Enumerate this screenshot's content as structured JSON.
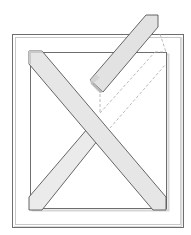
{
  "diagram": {
    "title": "",
    "colors": {
      "background": "#ffffff",
      "frame_stroke": "#6e6e6e",
      "frame_light": "#c8c8c8",
      "frame_shadow": "#b4b4b4",
      "brace_fill": "#e4e4e4",
      "brace_fill_dark": "#cfcfcf",
      "brace_stroke": "#555555",
      "dashed": "#a8a8a8"
    },
    "elements": [
      {
        "id": "outer-frame",
        "label": ""
      },
      {
        "id": "inner-opening",
        "label": ""
      },
      {
        "id": "brace-diagonal-down",
        "label": ""
      },
      {
        "id": "brace-diagonal-up-lower",
        "label": ""
      },
      {
        "id": "brace-lifted",
        "label": ""
      },
      {
        "id": "ghost-outline",
        "label": ""
      }
    ]
  }
}
